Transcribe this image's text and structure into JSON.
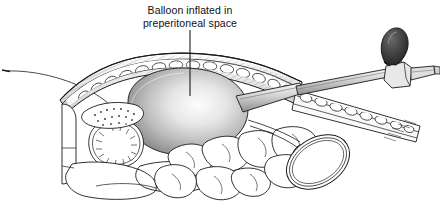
{
  "illustration": {
    "title": "Balloon dissection of preperitoneal space",
    "background_color": "#ffffff",
    "line_color": "#1a1a1a",
    "caption": {
      "line1": "Balloon inflated in",
      "line2": "preperitoneal space",
      "leader_line": "vertical-pointer-to-balloon"
    },
    "structures": [
      {
        "name": "abdominal-wall",
        "label": "Layered anterior abdominal wall with skin, fat and muscle"
      },
      {
        "name": "subcutaneous-fat",
        "label": "Stippled fat layer"
      },
      {
        "name": "rectus-muscle",
        "label": "Hatched muscle layer"
      },
      {
        "name": "balloon",
        "label": "Inflated dissection balloon",
        "shading": "radial-gradient-highlight"
      },
      {
        "name": "balloon-trocar-shaft",
        "label": "Trocar shaft entering balloon"
      },
      {
        "name": "trocar-hub",
        "label": "Valve hub assembly"
      },
      {
        "name": "insufflation-bulb",
        "label": "Hand inflation bulb",
        "color": "#3c3c3c"
      },
      {
        "name": "bladder",
        "label": "Bladder with mucosal rugae"
      },
      {
        "name": "pubic-bone",
        "label": "Pubic bone cross-section"
      },
      {
        "name": "bowel-loops",
        "label": "Coiled small bowel loops"
      },
      {
        "name": "bowel-cross-section",
        "label": "Elliptical bowel loop in cross-section"
      },
      {
        "name": "peritoneum-leader",
        "label": "Thin leader line to peritoneum"
      }
    ]
  }
}
